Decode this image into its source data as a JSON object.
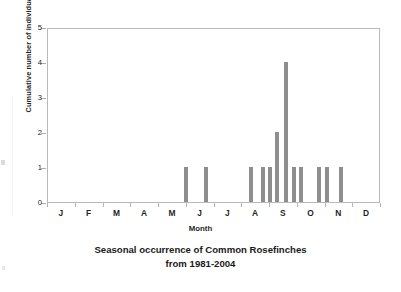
{
  "figure": {
    "caption_line1": "Seasonal occurrence of Common Rosefinches",
    "caption_line2": "from 1981-2004"
  },
  "axes": {
    "ylabel": "Cumulative number of individuals",
    "xlabel": "Month",
    "yticks": [
      "0",
      "1",
      "2",
      "3",
      "4",
      "5"
    ],
    "xticks": [
      "J",
      "F",
      "M",
      "A",
      "M",
      "J",
      "J",
      "A",
      "S",
      "O",
      "N",
      "D"
    ]
  },
  "colors": {
    "bar": "#8e8e8e",
    "frame": "#b9b9b9",
    "text": "#1f1f1f",
    "background": "#ffffff"
  },
  "chart_data": {
    "type": "bar",
    "title": "Seasonal occurrence of Common Rosefinches from 1981-2004",
    "xlabel": "Month",
    "ylabel": "Cumulative number of individuals",
    "categories": [
      "J",
      "F",
      "M",
      "A",
      "M",
      "J",
      "J",
      "A",
      "S",
      "O",
      "N",
      "D"
    ],
    "ylim": [
      0,
      5
    ],
    "xlim": [
      0,
      12
    ],
    "grid": false,
    "legend": null,
    "note": "Bars plotted at sub-monthly (pentad/decade) resolution; x positions given in months from the start of January.",
    "bars": [
      {
        "x_month": 4.98,
        "value": 1
      },
      {
        "x_month": 5.7,
        "value": 1
      },
      {
        "x_month": 7.33,
        "value": 1
      },
      {
        "x_month": 7.76,
        "value": 1
      },
      {
        "x_month": 8.01,
        "value": 1
      },
      {
        "x_month": 8.27,
        "value": 2
      },
      {
        "x_month": 8.59,
        "value": 4
      },
      {
        "x_month": 8.85,
        "value": 1
      },
      {
        "x_month": 9.1,
        "value": 1
      },
      {
        "x_month": 9.75,
        "value": 1
      },
      {
        "x_month": 10.04,
        "value": 1
      },
      {
        "x_month": 10.55,
        "value": 1
      }
    ],
    "monthly_totals": {
      "J": 0,
      "F": 0,
      "M": 0,
      "A": 0,
      "M2": 1,
      "J2": 1,
      "J3": 0,
      "A2": 3,
      "S": 7,
      "O": 2,
      "N": 1,
      "D": 0
    },
    "total_individuals": 15,
    "max_value": 4,
    "peak_month": "S"
  }
}
